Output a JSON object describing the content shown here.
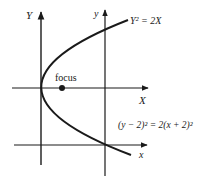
{
  "diagram": {
    "type": "parabola-coordinate-translation",
    "axes": {
      "big_y_label": "Y",
      "big_x_label": "X",
      "small_y_label": "y",
      "small_x_label": "x"
    },
    "focus_label": "focus",
    "equation_translated": "Y² = 2X",
    "equation_original": "(y − 2)² = 2(x + 2)²",
    "colors": {
      "line": "#1a1a1a",
      "background": "#ffffff"
    }
  }
}
